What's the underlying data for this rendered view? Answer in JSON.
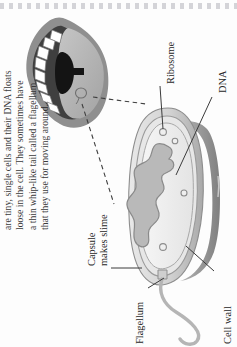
{
  "page": {
    "kind": "textbook-page-scan",
    "orientation": "rotated-90-ccw",
    "ornament": "dotted-border"
  },
  "body_text": {
    "lines": [
      "are tiny, single cells and their DNA floats",
      "loose in the cell. They sometimes have",
      "a thin whip-like tail called a flagellum",
      "that they use for moving around."
    ],
    "full": "are tiny, single cells and their DNA floats loose in the cell. They sometimes have a thin whip-like tail called a flagellum that they use for moving around."
  },
  "diagram": {
    "labels": [
      {
        "id": "ribosome",
        "text": "Ribosome"
      },
      {
        "id": "dna",
        "text": "DNA"
      },
      {
        "id": "capsule",
        "line1": "Capsule",
        "line2": "makes slime"
      },
      {
        "id": "flagellum",
        "text": "Flagellum"
      },
      {
        "id": "cell-wall",
        "text": "Cell wall"
      }
    ],
    "inset": {
      "id": "mouth-illustration",
      "description": "open mouth with teeth and tongue"
    }
  },
  "colors": {
    "ink": "#2b2b2b",
    "leader": "#3b3b3b",
    "dotted_border": "#d4d4d8",
    "capsule_outer": "#cfcfcf",
    "capsule_mid": "#e2e2e2",
    "cytoplasm": "#f0f0f0",
    "dna_fill": "#bdbdbd",
    "cell_shadow": "#8e8e8e",
    "flagellum": "#b9b9b9",
    "mouth_dark": "#9a9a9a",
    "tongue": "#b5b5b5",
    "teeth": "#ffffff",
    "throat": "#1a1a1a"
  }
}
